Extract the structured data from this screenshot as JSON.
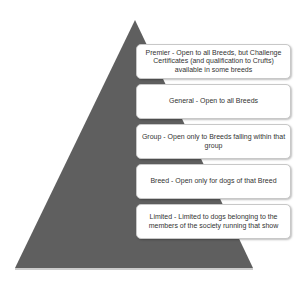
{
  "diagram": {
    "type": "pyramid",
    "pyramid_color": "#5f5f5f",
    "levels": [
      {
        "label": "Premier - Open to all Breeds, but Challenge Certificates (and qualification to Crufts) available in some breeds"
      },
      {
        "label": "General - Open to all Breeds"
      },
      {
        "label": "Group - Open only to Breeds falling within that group"
      },
      {
        "label": "Breed - Open only for dogs of that Breed"
      },
      {
        "label": "Limited - Limited to dogs belonging to the members of the society running that show"
      }
    ]
  }
}
